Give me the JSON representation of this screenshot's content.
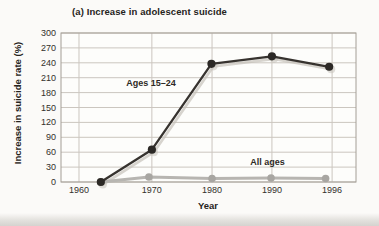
{
  "figure": {
    "title": "(a) Increase in adolescent suicide",
    "x_axis_title": "Year",
    "y_axis_title": "Increase in suicide rate (%)"
  },
  "chart_data": {
    "type": "line",
    "title": "(a) Increase in adolescent suicide",
    "xlabel": "Year",
    "ylabel": "Increase in suicide rate (%)",
    "ylim": [
      0,
      300
    ],
    "y_tick_step": 30,
    "y_ticks": [
      300,
      270,
      240,
      210,
      180,
      150,
      120,
      90,
      60,
      30,
      0
    ],
    "x_ticks": [
      {
        "label": "1960",
        "frac": 0.061
      },
      {
        "label": "1970",
        "frac": 0.308
      },
      {
        "label": "1980",
        "frac": 0.512
      },
      {
        "label": "1990",
        "frac": 0.715
      },
      {
        "label": "1996",
        "frac": 0.919
      }
    ],
    "grid": true,
    "legend_position": "inline-annotations",
    "colors": {
      "gridline": "#cbc6bf",
      "plot_border": "#a49e96",
      "text": "#33302b",
      "print_echo": "#c6c2bb"
    },
    "series": [
      {
        "name": "Ages 15–24",
        "color": "#37332f",
        "dot_color": "#2c2926",
        "line_width": 2.3,
        "dot_radius": 4.1,
        "print_echo": true,
        "points": [
          {
            "year": 1962,
            "x_frac": 0.135,
            "value": 0
          },
          {
            "year": 1970,
            "x_frac": 0.308,
            "value": 65
          },
          {
            "year": 1980,
            "x_frac": 0.51,
            "value": 238
          },
          {
            "year": 1990,
            "x_frac": 0.715,
            "value": 253
          },
          {
            "year": 1996,
            "x_frac": 0.909,
            "value": 232
          }
        ]
      },
      {
        "name": "All ages",
        "color": "#b7b5b1",
        "dot_color": "#a8a6a2",
        "line_width": 3,
        "dot_radius": 3.8,
        "print_echo": false,
        "points": [
          {
            "year": 1962,
            "x_frac": 0.135,
            "value": 0
          },
          {
            "year": 1970,
            "x_frac": 0.298,
            "value": 10
          },
          {
            "year": 1980,
            "x_frac": 0.512,
            "value": 7
          },
          {
            "year": 1990,
            "x_frac": 0.712,
            "value": 8
          },
          {
            "year": 1996,
            "x_frac": 0.897,
            "value": 7
          }
        ]
      }
    ],
    "annotations": [
      {
        "text": "Ages 15–24",
        "x_frac": 0.305,
        "y_value": 200
      },
      {
        "text": "All ages",
        "x_frac": 0.7,
        "y_value": 40
      }
    ]
  }
}
